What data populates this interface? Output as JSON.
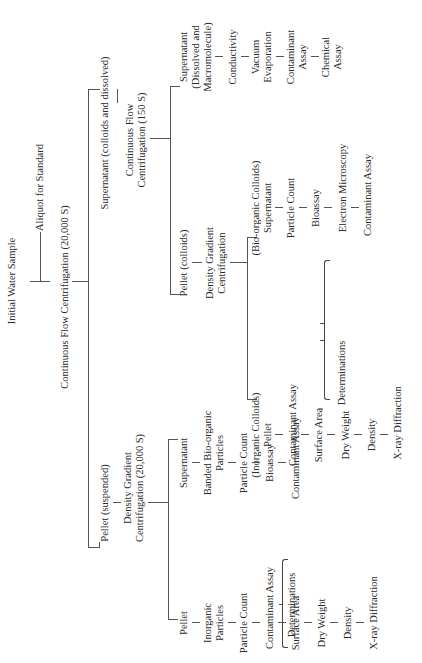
{
  "diagram": {
    "root": "Initial Water Sample",
    "aliquot": "Aliquot for Standard",
    "cf1": "Continuous Flow Centrifugation (20,000 S)",
    "sup1": "Supernatant (colloids and dissolved)",
    "cf2_line1": "Continuous Flow",
    "cf2_line2": "Centrifugation (150 S)",
    "sup2_line1": "Supernatant",
    "sup2_line2": "(Dissolved and",
    "sup2_line3": "Macromolecule)",
    "sup2_steps": [
      "Conductivity",
      "Vacuum",
      "Evaporation",
      "Contaminant",
      "Assay",
      "Chemical",
      "Assay"
    ],
    "pellet_colloids": "Pellet (colloids)",
    "dgc2_line1": "Density Gradient",
    "dgc2_line2": "Centrifugation",
    "bio_colloids_line1": "(Bio-organic Colloids)",
    "bio_colloids_line2": "Supernatant",
    "bio_colloids_steps": [
      "Particle Count",
      "Bioassay",
      "Electron Microscopy",
      "Contaminant Assay"
    ],
    "inorg_colloids_line1": "(Inorganic Colloids)",
    "inorg_colloids_line2": "Pellet",
    "inorg_colloids_steps": [
      "Contaminant Assay",
      "Surface Area",
      "Dry Weight",
      "Density",
      "X-ray Diffraction"
    ],
    "determinations_a": "Determinations",
    "pellet_suspended": "Pellet (suspended)",
    "dgc1_line1": "Density Gradient",
    "dgc1_line2": "Centrifugation (20,000 S)",
    "susp_supernatant": "Supernatant",
    "banded_line1": "Banded Bio-organic",
    "banded_line2": "Particles",
    "banded_steps": [
      "Particle Count",
      "Bioassay",
      "Contaminant Assay"
    ],
    "susp_pellet": "Pellet",
    "inorg_particles_line1": "Inorganic",
    "inorg_particles_line2": "Particles",
    "inorg_particles_steps": [
      "Particle Count",
      "Contaminant Assay",
      "Surface Area",
      "Dry Weight",
      "Density",
      "X-ray Diffraction"
    ],
    "determinations_b": "Determinations"
  }
}
